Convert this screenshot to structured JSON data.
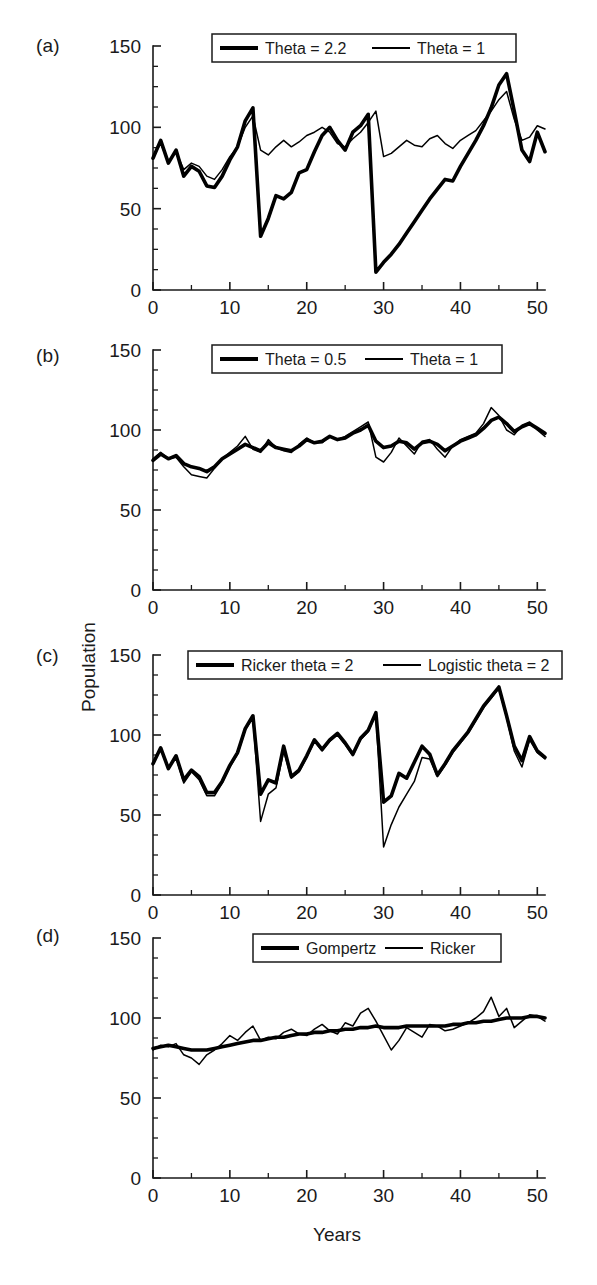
{
  "figure": {
    "axis_title_y": "Population",
    "axis_title_x": "Years",
    "panel_labels": [
      "(a)",
      "(b)",
      "(c)",
      "(d)"
    ]
  },
  "chart_data": [
    {
      "type": "line",
      "panel": "(a)",
      "title": "",
      "xlabel": "Years",
      "ylabel": "Population",
      "xlim": [
        0,
        51
      ],
      "ylim": [
        0,
        150
      ],
      "xticks": [
        0,
        10,
        20,
        30,
        40,
        50
      ],
      "yticks": [
        0,
        50,
        100,
        150
      ],
      "xminor_step": 5,
      "yminor_step": 12.5,
      "grid": false,
      "legend_position": "top-center",
      "series": [
        {
          "name": "Theta = 2.2",
          "style": "thick",
          "x": [
            0,
            1,
            2,
            3,
            4,
            5,
            6,
            7,
            8,
            9,
            10,
            11,
            12,
            13,
            14,
            15,
            16,
            17,
            18,
            19,
            20,
            21,
            22,
            23,
            24,
            25,
            26,
            27,
            28,
            29,
            30,
            31,
            32,
            33,
            34,
            35,
            36,
            37,
            38,
            39,
            40,
            41,
            42,
            43,
            44,
            45,
            46,
            47,
            48,
            49,
            50,
            51
          ],
          "values": [
            81,
            92,
            78,
            86,
            70,
            76,
            73,
            64,
            63,
            70,
            80,
            88,
            104,
            112,
            33,
            44,
            58,
            56,
            60,
            72,
            74,
            85,
            95,
            100,
            92,
            86,
            97,
            101,
            108,
            11,
            17,
            22,
            28,
            35,
            42,
            49,
            56,
            62,
            68,
            67,
            76,
            84,
            92,
            101,
            112,
            126,
            133,
            110,
            86,
            79,
            97,
            85
          ]
        },
        {
          "name": "Theta = 1",
          "style": "thin",
          "x": [
            0,
            1,
            2,
            3,
            4,
            5,
            6,
            7,
            8,
            9,
            10,
            11,
            12,
            13,
            14,
            15,
            16,
            17,
            18,
            19,
            20,
            21,
            22,
            23,
            24,
            25,
            26,
            27,
            28,
            29,
            30,
            31,
            32,
            33,
            34,
            35,
            36,
            37,
            38,
            39,
            40,
            41,
            42,
            43,
            44,
            45,
            46,
            47,
            48,
            49,
            50,
            51
          ],
          "values": [
            82,
            90,
            79,
            85,
            74,
            78,
            76,
            70,
            68,
            74,
            82,
            88,
            100,
            107,
            86,
            83,
            88,
            92,
            88,
            91,
            95,
            97,
            100,
            97,
            90,
            88,
            93,
            97,
            103,
            110,
            82,
            84,
            88,
            92,
            89,
            88,
            93,
            95,
            90,
            87,
            92,
            95,
            98,
            104,
            110,
            117,
            122,
            105,
            92,
            94,
            101,
            99
          ]
        }
      ]
    },
    {
      "type": "line",
      "panel": "(b)",
      "title": "",
      "xlabel": "Years",
      "ylabel": "Population",
      "xlim": [
        0,
        51
      ],
      "ylim": [
        0,
        150
      ],
      "xticks": [
        0,
        10,
        20,
        30,
        40,
        50
      ],
      "yticks": [
        0,
        50,
        100,
        150
      ],
      "xminor_step": 5,
      "yminor_step": 12.5,
      "grid": false,
      "legend_position": "top-center",
      "series": [
        {
          "name": "Theta = 0.5",
          "style": "thick",
          "x": [
            0,
            1,
            2,
            3,
            4,
            5,
            6,
            7,
            8,
            9,
            10,
            11,
            12,
            13,
            14,
            15,
            16,
            17,
            18,
            19,
            20,
            21,
            22,
            23,
            24,
            25,
            26,
            27,
            28,
            29,
            30,
            31,
            32,
            33,
            34,
            35,
            36,
            37,
            38,
            39,
            40,
            41,
            42,
            43,
            44,
            45,
            46,
            47,
            48,
            49,
            50,
            51
          ],
          "values": [
            81,
            85,
            82,
            84,
            79,
            77,
            76,
            74,
            77,
            82,
            85,
            88,
            91,
            89,
            87,
            92,
            89,
            88,
            87,
            90,
            94,
            92,
            93,
            96,
            94,
            95,
            98,
            100,
            103,
            93,
            89,
            90,
            93,
            92,
            88,
            92,
            93,
            91,
            87,
            90,
            93,
            95,
            97,
            101,
            106,
            108,
            104,
            99,
            102,
            104,
            101,
            98
          ]
        },
        {
          "name": "Theta = 1",
          "style": "thin",
          "x": [
            0,
            1,
            2,
            3,
            4,
            5,
            6,
            7,
            8,
            9,
            10,
            11,
            12,
            13,
            14,
            15,
            16,
            17,
            18,
            19,
            20,
            21,
            22,
            23,
            24,
            25,
            26,
            27,
            28,
            29,
            30,
            31,
            32,
            33,
            34,
            35,
            36,
            37,
            38,
            39,
            40,
            41,
            42,
            43,
            44,
            45,
            46,
            47,
            48,
            49,
            50,
            51
          ],
          "values": [
            82,
            86,
            82,
            83,
            77,
            72,
            71,
            70,
            76,
            82,
            86,
            90,
            96,
            88,
            86,
            94,
            89,
            87,
            86,
            91,
            95,
            92,
            92,
            96,
            94,
            96,
            99,
            102,
            105,
            83,
            80,
            86,
            95,
            90,
            85,
            93,
            94,
            88,
            83,
            90,
            94,
            96,
            98,
            104,
            114,
            109,
            100,
            97,
            103,
            105,
            100,
            96
          ]
        }
      ]
    },
    {
      "type": "line",
      "panel": "(c)",
      "title": "",
      "xlabel": "Years",
      "ylabel": "Population",
      "xlim": [
        0,
        51
      ],
      "ylim": [
        0,
        150
      ],
      "xticks": [
        0,
        10,
        20,
        30,
        40,
        50
      ],
      "yticks": [
        0,
        50,
        100,
        150
      ],
      "xminor_step": 5,
      "yminor_step": 12.5,
      "grid": false,
      "legend_position": "top-center",
      "series": [
        {
          "name": "Ricker theta = 2",
          "style": "thick",
          "x": [
            0,
            1,
            2,
            3,
            4,
            5,
            6,
            7,
            8,
            9,
            10,
            11,
            12,
            13,
            14,
            15,
            16,
            17,
            18,
            19,
            20,
            21,
            22,
            23,
            24,
            25,
            26,
            27,
            28,
            29,
            30,
            31,
            32,
            33,
            34,
            35,
            36,
            37,
            38,
            39,
            40,
            41,
            42,
            43,
            44,
            45,
            46,
            47,
            48,
            49,
            50,
            51
          ],
          "values": [
            82,
            92,
            79,
            87,
            72,
            78,
            74,
            64,
            64,
            71,
            81,
            89,
            104,
            112,
            63,
            72,
            70,
            93,
            74,
            78,
            87,
            97,
            91,
            97,
            101,
            95,
            88,
            98,
            103,
            114,
            58,
            62,
            76,
            73,
            83,
            93,
            88,
            75,
            82,
            90,
            96,
            102,
            110,
            118,
            124,
            130,
            112,
            93,
            84,
            99,
            90,
            86
          ]
        },
        {
          "name": "Logistic theta = 2",
          "style": "thin",
          "x": [
            0,
            1,
            2,
            3,
            4,
            5,
            6,
            7,
            8,
            9,
            10,
            11,
            12,
            13,
            14,
            15,
            16,
            17,
            18,
            19,
            20,
            21,
            22,
            23,
            24,
            25,
            26,
            27,
            28,
            29,
            30,
            31,
            32,
            33,
            34,
            35,
            36,
            37,
            38,
            39,
            40,
            41,
            42,
            43,
            44,
            45,
            46,
            47,
            48,
            49,
            50,
            51
          ],
          "values": [
            82,
            92,
            79,
            86,
            70,
            77,
            72,
            62,
            62,
            70,
            80,
            88,
            103,
            111,
            46,
            63,
            67,
            90,
            73,
            77,
            86,
            96,
            90,
            96,
            100,
            94,
            87,
            97,
            102,
            113,
            30,
            44,
            55,
            63,
            71,
            86,
            85,
            74,
            81,
            89,
            95,
            101,
            109,
            117,
            123,
            129,
            111,
            90,
            80,
            97,
            89,
            85
          ]
        }
      ]
    },
    {
      "type": "line",
      "panel": "(d)",
      "title": "",
      "xlabel": "Years",
      "ylabel": "Population",
      "xlim": [
        0,
        51
      ],
      "ylim": [
        0,
        150
      ],
      "xticks": [
        0,
        10,
        20,
        30,
        40,
        50
      ],
      "yticks": [
        0,
        50,
        100,
        150
      ],
      "xminor_step": 5,
      "yminor_step": 12.5,
      "grid": false,
      "legend_position": "top-center",
      "series": [
        {
          "name": "Gompertz",
          "style": "thick",
          "x": [
            0,
            1,
            2,
            3,
            4,
            5,
            6,
            7,
            8,
            9,
            10,
            11,
            12,
            13,
            14,
            15,
            16,
            17,
            18,
            19,
            20,
            21,
            22,
            23,
            24,
            25,
            26,
            27,
            28,
            29,
            30,
            31,
            32,
            33,
            34,
            35,
            36,
            37,
            38,
            39,
            40,
            41,
            42,
            43,
            44,
            45,
            46,
            47,
            48,
            49,
            50,
            51
          ],
          "values": [
            81,
            82,
            83,
            82,
            81,
            80,
            80,
            80,
            81,
            82,
            83,
            84,
            85,
            86,
            86,
            87,
            88,
            88,
            89,
            90,
            90,
            91,
            91,
            92,
            92,
            93,
            93,
            94,
            94,
            95,
            94,
            94,
            94,
            95,
            95,
            95,
            95,
            95,
            95,
            96,
            96,
            97,
            97,
            98,
            98,
            99,
            100,
            100,
            100,
            101,
            101,
            100
          ]
        },
        {
          "name": "Ricker",
          "style": "thin",
          "x": [
            0,
            1,
            2,
            3,
            4,
            5,
            6,
            7,
            8,
            9,
            10,
            11,
            12,
            13,
            14,
            15,
            16,
            17,
            18,
            19,
            20,
            21,
            22,
            23,
            24,
            25,
            26,
            27,
            28,
            29,
            30,
            31,
            32,
            33,
            34,
            35,
            36,
            37,
            38,
            39,
            40,
            41,
            42,
            43,
            44,
            45,
            46,
            47,
            48,
            49,
            50,
            51
          ],
          "values": [
            80,
            83,
            82,
            84,
            77,
            75,
            71,
            77,
            80,
            84,
            89,
            86,
            91,
            95,
            86,
            88,
            87,
            91,
            93,
            90,
            89,
            93,
            96,
            92,
            90,
            97,
            95,
            103,
            106,
            98,
            89,
            80,
            86,
            94,
            91,
            88,
            96,
            95,
            92,
            93,
            95,
            97,
            100,
            104,
            113,
            101,
            106,
            94,
            98,
            102,
            101,
            98
          ]
        }
      ]
    }
  ],
  "legends": [
    {
      "panel": "(a)",
      "entries": [
        {
          "label": "Theta = 2.2",
          "style": "thick"
        },
        {
          "label": "Theta = 1",
          "style": "thin"
        }
      ]
    },
    {
      "panel": "(b)",
      "entries": [
        {
          "label": "Theta = 0.5",
          "style": "thick"
        },
        {
          "label": "Theta = 1",
          "style": "thin"
        }
      ]
    },
    {
      "panel": "(c)",
      "entries": [
        {
          "label": "Ricker theta = 2",
          "style": "thick"
        },
        {
          "label": "Logistic theta = 2",
          "style": "thin"
        }
      ]
    },
    {
      "panel": "(d)",
      "entries": [
        {
          "label": "Gompertz",
          "style": "thick"
        },
        {
          "label": "Ricker",
          "style": "thin"
        }
      ]
    }
  ]
}
